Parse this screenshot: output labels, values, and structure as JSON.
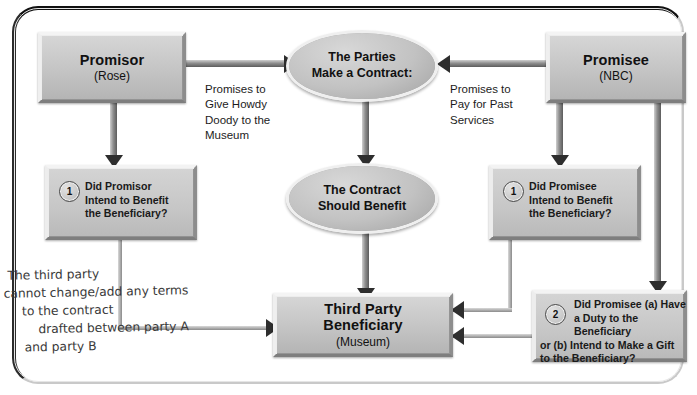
{
  "diagram": {
    "nodes": {
      "promisor": {
        "title": "Promisor",
        "sub": "(Rose)"
      },
      "promisee": {
        "title": "Promisee",
        "sub": "(NBC)"
      },
      "parties_oval": {
        "line1": "The Parties",
        "line2": "Make a Contract:"
      },
      "contract_oval": {
        "line1": "The Contract",
        "line2": "Should Benefit"
      },
      "beneficiary": {
        "line1": "Third Party",
        "line2": "Beneficiary",
        "sub": "(Museum)"
      }
    },
    "questions": {
      "promisor_q1": {
        "number": "1",
        "line1": "Did Promisor",
        "line2": "Intend to Benefit",
        "line3": "the Beneficiary?"
      },
      "promisee_q1": {
        "number": "1",
        "line1": "Did Promisee",
        "line2": "Intend to Benefit",
        "line3": "the Beneficiary?"
      },
      "promisee_q2": {
        "number": "2",
        "line1": "Did Promisee (a) Have",
        "line2": "a Duty to the Beneficiary",
        "line3": "or (b) Intend to Make a Gift",
        "line4": "to the Beneficiary?"
      }
    },
    "edge_labels": {
      "left": {
        "line1": "Promises to",
        "line2": "Give Howdy",
        "line3": "Doody to the",
        "line4": "Museum"
      },
      "right": {
        "line1": "Promises to",
        "line2": "Pay for Past",
        "line3": "Services"
      }
    },
    "handwritten_note": {
      "line1": "The third party",
      "line2": "cannot change/add any terms",
      "line3": "to the contract",
      "line4": "drafted between party A",
      "line5": "and party B"
    },
    "colors": {
      "node_fill": "#c4c4c4",
      "arrow_head": "#2e2e2e",
      "frame": "#111111",
      "text": "#111111",
      "note_ink": "#3a3a3a"
    }
  }
}
